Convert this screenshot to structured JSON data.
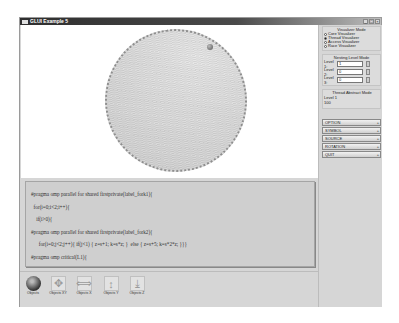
{
  "window": {
    "title": "GLUI Example 5",
    "controls": [
      "_",
      "□",
      "×"
    ]
  },
  "visualizer_mode": {
    "title": "Visualizer Mode",
    "options": [
      {
        "label": "Core Visualizer",
        "checked": false
      },
      {
        "label": "Thread Visualizer",
        "checked": true
      },
      {
        "label": "Access Visualizer",
        "checked": false
      },
      {
        "label": "Race Visualizer",
        "checked": false
      }
    ]
  },
  "nesting_level_mode": {
    "title": "Nesting Level Mode",
    "levels": [
      {
        "label": "Level 1:",
        "value": "1"
      },
      {
        "label": "Level 2:",
        "value": "0"
      },
      {
        "label": "Level 3:",
        "value": "0"
      }
    ]
  },
  "thread_abstract_mode": {
    "title": "Thread Abstract Mode",
    "level": "Level 1",
    "value": "100"
  },
  "menu_buttons": [
    {
      "label": "OPTION",
      "icon": "+"
    },
    {
      "label": "SYMBOL",
      "icon": "+"
    },
    {
      "label": "SOURCE",
      "icon": "+"
    },
    {
      "label": "ROTATION",
      "icon": "+"
    },
    {
      "label": "QUIT",
      "icon": "+"
    }
  ],
  "code": {
    "lines": [
      "#pragma omp parallel for shared firstprivate(label_fork1){",
      "  for(i=0;i<2;i++){",
      "    if(i>0){",
      "#pragma omp parallel for shared firstprivate(label_fork2){",
      "      for(i=0;j<2;j++){ if(j<1) { z=s+1; k=s*z; }  else { z=s+5; k=s*2*z; }}}",
      "#pragma omp critical(L1){"
    ]
  },
  "toolbar": {
    "tools": [
      {
        "label": "Objects",
        "icon": "sphere-icon",
        "glyph": ""
      },
      {
        "label": "Objects XY",
        "icon": "move-xy-icon",
        "glyph": "✥"
      },
      {
        "label": "Objects X",
        "icon": "move-x-icon",
        "glyph": "⟺"
      },
      {
        "label": "Objects Y",
        "icon": "move-y-icon",
        "glyph": "↕"
      },
      {
        "label": "Objects Z",
        "icon": "move-z-icon",
        "glyph": "⤓"
      }
    ]
  }
}
